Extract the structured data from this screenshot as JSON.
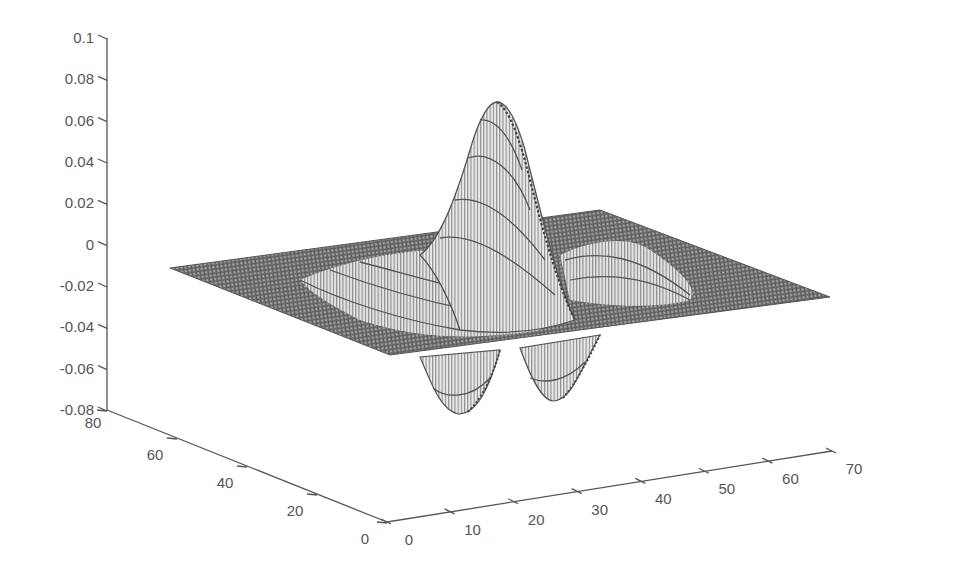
{
  "chart_data": {
    "type": "surface3d",
    "title": "",
    "xlabel": "",
    "ylabel": "",
    "zlabel": "",
    "x_range": [
      0,
      70
    ],
    "y_range": [
      0,
      80
    ],
    "z_range": [
      -0.08,
      0.1
    ],
    "x_ticks": [
      "0",
      "10",
      "20",
      "30",
      "40",
      "50",
      "60",
      "70"
    ],
    "y_ticks": [
      "0",
      "20",
      "40",
      "60",
      "80"
    ],
    "z_ticks": [
      "0.1",
      "0.08",
      "0.06",
      "0.04",
      "0.02",
      "0",
      "-0.02",
      "-0.04",
      "-0.06",
      "-0.08"
    ],
    "features": [
      {
        "name": "central peak",
        "x": 32,
        "y": 40,
        "z": 0.07
      },
      {
        "name": "left trough",
        "x": 28,
        "y": 25,
        "z": -0.07
      },
      {
        "name": "right trough",
        "x": 40,
        "y": 25,
        "z": -0.067
      }
    ],
    "grid": false,
    "legend": "none",
    "colors": {
      "mesh": "#555555",
      "axis": "#555555",
      "background": "#ffffff"
    }
  },
  "axes": {
    "z": {
      "labels": [
        "0.1",
        "0.08",
        "0.06",
        "0.04",
        "0.02",
        "0",
        "-0.02",
        "-0.04",
        "-0.06",
        "-0.08"
      ]
    },
    "y": {
      "labels": [
        "80",
        "60",
        "40",
        "20",
        "0"
      ]
    },
    "x": {
      "labels": [
        "0",
        "10",
        "20",
        "30",
        "40",
        "50",
        "60",
        "70"
      ]
    }
  }
}
